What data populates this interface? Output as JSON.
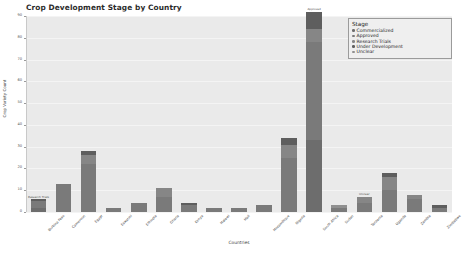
{
  "chart_data": {
    "type": "bar",
    "title": "Crop Development Stage by Country",
    "xlabel": "Countries",
    "ylabel": "Crop Variety Count",
    "ylim": [
      0,
      90
    ],
    "yticks": [
      0,
      10,
      20,
      30,
      40,
      50,
      60,
      70,
      80,
      90
    ],
    "grid": true,
    "stacked": true,
    "legend": {
      "title": "Stage",
      "position": "top-right",
      "entries": [
        {
          "label": "Commercialized",
          "color": "#6d6d6d"
        },
        {
          "label": "Approved",
          "color": "#7a7a7a"
        },
        {
          "label": "Research Trials",
          "color": "#868686"
        },
        {
          "label": "Under Development",
          "color": "#5e5e5e"
        },
        {
          "label": "Unclear",
          "color": "#909090"
        }
      ]
    },
    "categories": [
      "Burkina Faso",
      "Cameroon",
      "Egypt",
      "Eswatini",
      "Ethiopia",
      "Ghana",
      "Kenya",
      "Malawi",
      "Mali",
      "Mozambique",
      "Nigeria",
      "South Africa",
      "Sudan",
      "Tanzania",
      "Uganda",
      "Zambia",
      "Zimbabwe"
    ],
    "series": [
      {
        "name": "Commercialized",
        "color": "#6d6d6d",
        "values": [
          2,
          0,
          0,
          0,
          0,
          0,
          0,
          0,
          0,
          0,
          0,
          33,
          0,
          0,
          0,
          0,
          0
        ]
      },
      {
        "name": "Approved",
        "color": "#7a7a7a",
        "values": [
          3,
          13,
          22,
          2,
          4,
          7,
          3,
          2,
          2,
          3,
          25,
          45,
          2,
          4,
          10,
          6,
          2
        ]
      },
      {
        "name": "Research Trials",
        "color": "#868686",
        "values": [
          0,
          0,
          4,
          0,
          0,
          4,
          0,
          0,
          0,
          0,
          6,
          6,
          0,
          3,
          6,
          2,
          0
        ]
      },
      {
        "name": "Under Development",
        "color": "#5e5e5e",
        "values": [
          1,
          0,
          2,
          0,
          0,
          0,
          1,
          0,
          0,
          0,
          3,
          8,
          0,
          0,
          2,
          0,
          1
        ]
      },
      {
        "name": "Unclear",
        "color": "#909090",
        "values": [
          0,
          0,
          0,
          0,
          0,
          0,
          0,
          0,
          0,
          0,
          0,
          0,
          1,
          0,
          0,
          0,
          0
        ]
      }
    ],
    "totals": [
      6,
      13,
      28,
      2,
      4,
      11,
      4,
      2,
      2,
      3,
      34,
      92,
      3,
      7,
      18,
      8,
      3
    ],
    "annotations": [
      {
        "category": "Burkina Faso",
        "text": "Research Trials"
      },
      {
        "category": "South Africa",
        "text": "Approved"
      },
      {
        "category": "Tanzania",
        "text": "Unclear"
      }
    ]
  }
}
